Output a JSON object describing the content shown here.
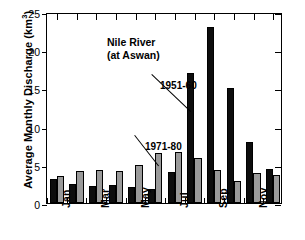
{
  "chart_data": {
    "type": "bar",
    "title": "Nile River (at Aswan)",
    "title_lines": [
      "Nile River",
      "(at Aswan)"
    ],
    "xlabel": "",
    "ylabel": "Average Monthly Discharge (km3)",
    "ylabel_main": "Average Monthly Discharge (km",
    "ylabel_sup": "3",
    "ylabel_tail": ")",
    "categories": [
      "Jan",
      "Feb",
      "Mar",
      "Apr",
      "May",
      "Jun",
      "Jul",
      "Aug",
      "Sep",
      "Oct",
      "Nov",
      "Dec"
    ],
    "xtick_labels": [
      "Jan",
      "Mar",
      "May",
      "Jul",
      "Sep",
      "Nov"
    ],
    "xtick_category_index": [
      0,
      2,
      4,
      6,
      8,
      10
    ],
    "ylim": [
      0,
      25
    ],
    "yticks": [
      0,
      5,
      10,
      15,
      20,
      25
    ],
    "ytick_labels": [
      "0",
      "5",
      "10",
      "15",
      "20",
      "25"
    ],
    "grid": false,
    "legend_position": "in-plot-annotations",
    "series": [
      {
        "name": "1951-60",
        "color": "#0d0d0d",
        "values": [
          3.2,
          2.5,
          2.2,
          2.3,
          2.1,
          1.8,
          4.1,
          17.0,
          23.0,
          15.0,
          8.0,
          4.4
        ]
      },
      {
        "name": "1971-80",
        "color": "#9a9a9a",
        "values": [
          3.5,
          4.2,
          4.3,
          4.2,
          5.0,
          6.5,
          6.7,
          5.9,
          4.3,
          2.9,
          3.9,
          3.7
        ]
      }
    ],
    "annotations": [
      {
        "text": "1951-60",
        "points_to_series": "1951-60",
        "points_to_category": "Aug"
      },
      {
        "text": "1971-80",
        "points_to_series": "1971-80",
        "points_to_category": "Jun"
      }
    ]
  }
}
